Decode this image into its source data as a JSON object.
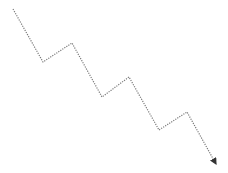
{
  "diagram": {
    "type": "zigzag-arrow-path",
    "line_color": "#7a7a7a",
    "arrow_color": "#333333",
    "line_style": "dotted",
    "stroke_width": 1.2,
    "points": [
      [
        13,
        9
      ],
      [
        43,
        62
      ],
      [
        72,
        43
      ],
      [
        102,
        97
      ],
      [
        129,
        77
      ],
      [
        159,
        130
      ],
      [
        187,
        112
      ],
      [
        216,
        164
      ]
    ],
    "arrow_at_end": true
  }
}
